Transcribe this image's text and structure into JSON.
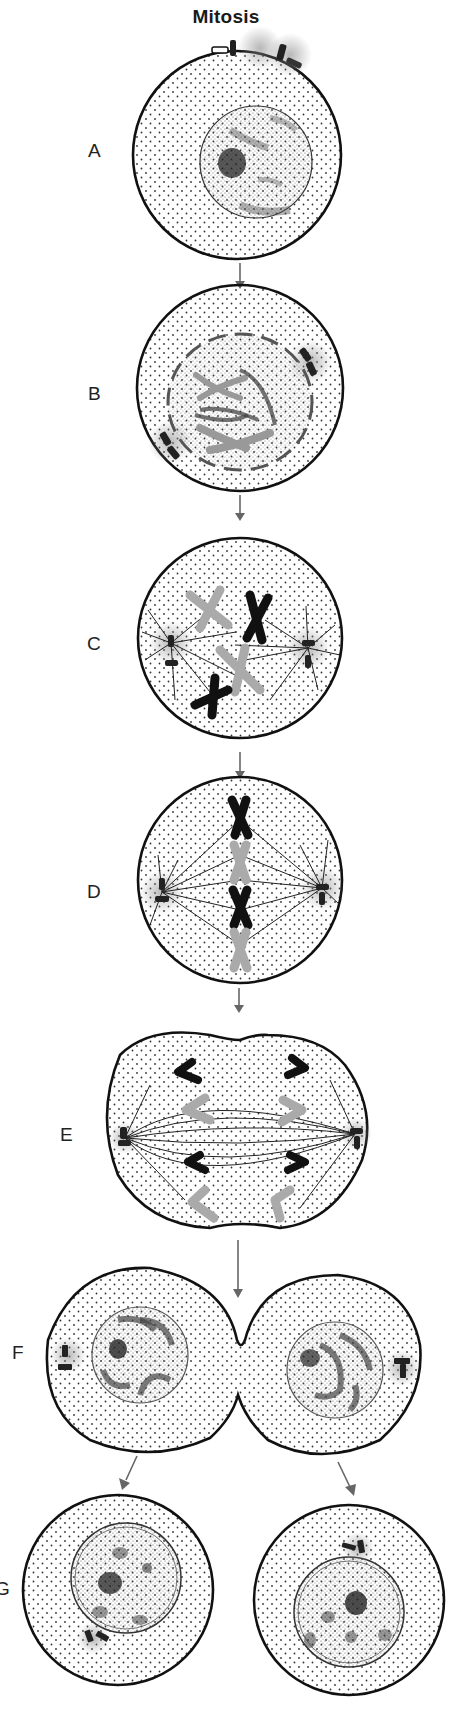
{
  "title": "Mitosis",
  "stages": [
    {
      "label": "A",
      "name": "interphase"
    },
    {
      "label": "B",
      "name": "prophase"
    },
    {
      "label": "C",
      "name": "prometaphase"
    },
    {
      "label": "D",
      "name": "metaphase"
    },
    {
      "label": "E",
      "name": "anaphase"
    },
    {
      "label": "F",
      "name": "telophase-cytokinesis"
    },
    {
      "label": "G",
      "name": "daughter-cells"
    }
  ],
  "colors": {
    "outline": "#111111",
    "arrow": "#666666",
    "dark_chromosome": "#111111",
    "light_chromosome": "#aaaaaa",
    "cytoplasm_dot": "#333333"
  }
}
